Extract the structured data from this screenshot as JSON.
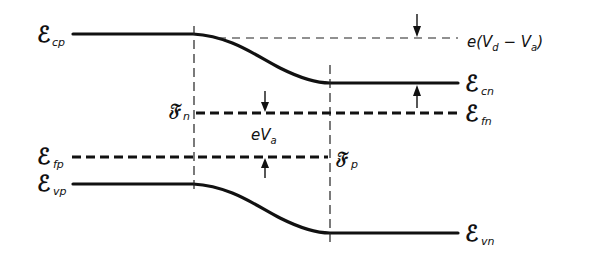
{
  "diagram": {
    "type": "energy-band-diagram",
    "labels": {
      "ecp": {
        "main": "ℰ",
        "sub": "cp"
      },
      "ecn": {
        "main": "ℰ",
        "sub": "cn"
      },
      "efn": {
        "main": "ℰ",
        "sub": "fn"
      },
      "efp": {
        "main": "ℰ",
        "sub": "fp"
      },
      "evp": {
        "main": "ℰ",
        "sub": "vp"
      },
      "evn": {
        "main": "ℰ",
        "sub": "vn"
      },
      "fn": {
        "main": "𝔉",
        "sub": "n"
      },
      "fp": {
        "main": "𝔉",
        "sub": "p"
      },
      "barrier": {
        "prefix": "e(V",
        "sub1": "d",
        "mid": " − V",
        "sub2": "a",
        "suffix": ")"
      },
      "applied": {
        "prefix": "eV",
        "sub": "a"
      }
    },
    "colors": {
      "line": "#111111",
      "background": "#ffffff"
    }
  }
}
